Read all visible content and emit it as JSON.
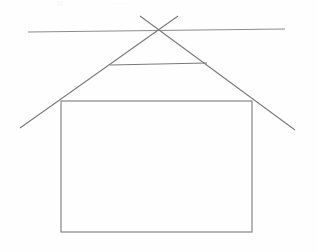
{
  "document": {
    "title": "House Outline Line Drawing",
    "background_color": "#fefefe",
    "width": 318,
    "height": 252
  },
  "style": {
    "stroke_color": "#7a7a7a",
    "stroke_color_light": "#9a9a9a",
    "stroke_width": 1.1
  },
  "artifacts": {
    "top_mark_left": "|||",
    "top_mark_right": "·······"
  },
  "chart_data": {
    "type": "line",
    "xlabel": "",
    "ylabel": "",
    "xlim": [
      0,
      318
    ],
    "ylim": [
      252,
      0
    ],
    "grid": false,
    "legend": "none",
    "shapes": [
      {
        "name": "long-horizontal-guide-line",
        "kind": "segment",
        "x": [
          28,
          285
        ],
        "y": [
          32,
          29
        ],
        "color": "#8c8c8c"
      },
      {
        "name": "left-roof-diagonal",
        "kind": "segment",
        "x": [
          178,
          20
        ],
        "y": [
          16,
          128
        ],
        "color": "#7a7a7a"
      },
      {
        "name": "right-roof-diagonal",
        "kind": "segment",
        "x": [
          140,
          295
        ],
        "y": [
          16,
          130
        ],
        "color": "#7a7a7a"
      },
      {
        "name": "collar-tie-horizontal",
        "kind": "segment",
        "x": [
          110,
          207
        ],
        "y": [
          65,
          63
        ],
        "color": "#7a7a7a"
      },
      {
        "name": "rectangle-body",
        "kind": "rect",
        "x": [
          61,
          252
        ],
        "y": [
          101,
          232
        ],
        "color": "#7a7a7a"
      }
    ],
    "points": {
      "roof-apex-crossing": [
        157,
        30
      ],
      "rect-top-left": [
        61,
        101
      ],
      "rect-top-right": [
        252,
        101
      ],
      "rect-bottom-left": [
        61,
        232
      ],
      "rect-bottom-right": [
        252,
        232
      ],
      "collar-left": [
        110,
        65
      ],
      "collar-right": [
        207,
        63
      ]
    }
  }
}
